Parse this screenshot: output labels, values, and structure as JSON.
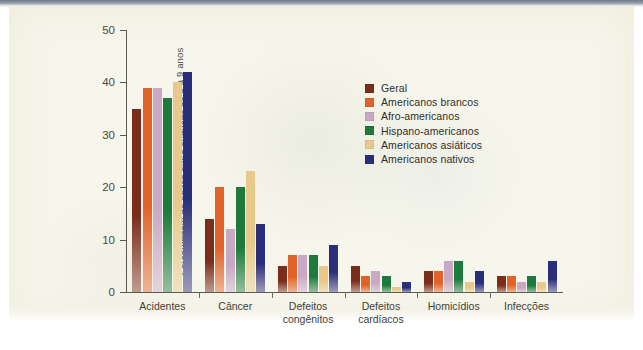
{
  "chart_data": {
    "type": "bar",
    "title": "",
    "xlabel": "",
    "ylabel": "Porcentagem de óbitos entre crianças de 5 a 9 anos",
    "ylim": [
      0,
      50
    ],
    "yticks": [
      0,
      10,
      20,
      30,
      40,
      50
    ],
    "grid": false,
    "legend_position": "inside-top-right",
    "categories": [
      "Acidentes",
      "Câncer",
      "Defeitos\ncongênitos",
      "Defeitos\ncardíacos",
      "Homicídios",
      "Infecções"
    ],
    "series": [
      {
        "name": "Geral",
        "color": "#7b2d1c",
        "values": [
          35,
          14,
          5,
          5,
          4,
          3
        ]
      },
      {
        "name": "Americanos brancos",
        "color": "#e2632a",
        "values": [
          39,
          20,
          7,
          3,
          4,
          3
        ]
      },
      {
        "name": "Afro-americanos",
        "color": "#c9a8c4",
        "values": [
          39,
          12,
          7,
          4,
          6,
          2
        ]
      },
      {
        "name": "Hispano-americanos",
        "color": "#1d7a3c",
        "values": [
          37,
          20,
          7,
          3,
          6,
          3
        ]
      },
      {
        "name": "Americanos asiáticos",
        "color": "#e8c98a",
        "values": [
          40,
          23,
          5,
          1,
          2,
          2
        ]
      },
      {
        "name": "Americanos nativos",
        "color": "#2b2f7a",
        "values": [
          42,
          13,
          9,
          2,
          4,
          6
        ]
      }
    ]
  },
  "legend": {
    "items": [
      "Geral",
      "Americanos brancos",
      "Afro-americanos",
      "Hispano-americanos",
      "Americanos asiáticos",
      "Americanos nativos"
    ]
  },
  "axis": {
    "y_title": "Porcentagem de óbitos entre crianças de 5 a 9 anos",
    "y_ticks": [
      "0",
      "10",
      "20",
      "30",
      "40",
      "50"
    ]
  }
}
